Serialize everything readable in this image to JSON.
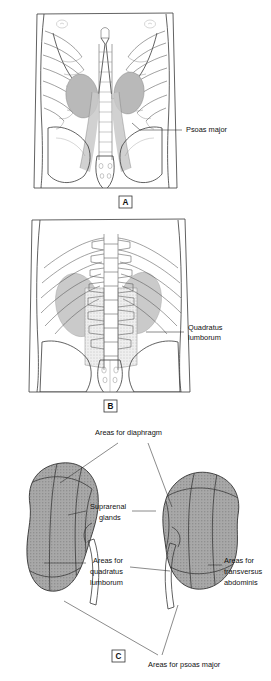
{
  "figure": {
    "background_color": "#ffffff",
    "line_color": "#333333",
    "organ_fill": "#b9b9b9",
    "muscle_fill": "#c9c9c9"
  },
  "panels": [
    {
      "id": "A",
      "letter": "A",
      "view": "anterior-abdominal-wall",
      "description": "Anterior view of trunk showing ribcage, vertebral column, pelvis, kidneys and psoas major muscles",
      "labels": [
        {
          "name": "psoas-major",
          "lines": [
            "Psoas major"
          ],
          "align": "left"
        }
      ]
    },
    {
      "id": "B",
      "letter": "B",
      "view": "posterior-abdominal-wall",
      "description": "Posterior view of trunk showing ribs, lumbar vertebrae, sacrum, kidneys and quadratus lumborum",
      "labels": [
        {
          "name": "quadratus-lumborum",
          "lines": [
            "Quadratus",
            "lumborum"
          ],
          "align": "left"
        }
      ]
    },
    {
      "id": "C",
      "letter": "C",
      "view": "posterior-surfaces-of-kidneys",
      "description": "Posterior surfaces of both kidneys showing contact areas with surrounding structures",
      "labels": [
        {
          "name": "areas-for-diaphragm",
          "lines": [
            "Areas for diaphragm"
          ],
          "align": "center"
        },
        {
          "name": "suprarenal-glands",
          "lines": [
            "Suprarenal",
            "glands"
          ],
          "align": "center"
        },
        {
          "name": "areas-for-quadratus-lumborum",
          "lines": [
            "Areas for",
            "quadratus",
            "lumborum"
          ],
          "align": "center"
        },
        {
          "name": "areas-for-transversus-abdominis",
          "lines": [
            "Areas for",
            "transversus",
            "abdominis"
          ],
          "align": "left"
        },
        {
          "name": "areas-for-psoas-major",
          "lines": [
            "Areas for psoas major"
          ],
          "align": "center"
        }
      ]
    }
  ],
  "text": {
    "psoas_major": "Psoas major",
    "quadratus_1": "Quadratus",
    "quadratus_2": "lumborum",
    "areas_diaphragm": "Areas for diaphragm",
    "suprarenal_1": "Suprarenal",
    "suprarenal_2": "glands",
    "quad_area_1": "Areas for",
    "quad_area_2": "quadratus",
    "quad_area_3": "lumborum",
    "transv_1": "Areas for",
    "transv_2": "transversus",
    "transv_3": "abdominis",
    "psoas_area": "Areas for psoas major",
    "letter_a": "A",
    "letter_b": "B",
    "letter_c": "C"
  }
}
